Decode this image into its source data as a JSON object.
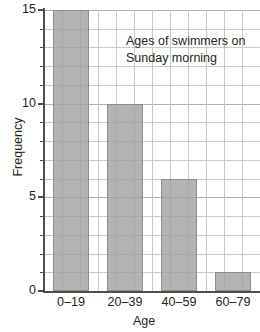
{
  "chart_data": {
    "type": "bar",
    "title": "",
    "annotation": "Ages of swimmers on\nSunday morning",
    "categories": [
      "0–19",
      "20–39",
      "40–59",
      "60–79"
    ],
    "values": [
      15,
      10,
      6,
      1
    ],
    "xlabel": "Age",
    "ylabel": "Frequency",
    "ylim": [
      0,
      15
    ],
    "y_ticks": [
      0,
      5,
      10,
      15
    ],
    "y_tick_labels": [
      "0",
      "5",
      "10",
      "15"
    ],
    "y_minor_step": 1,
    "grid": true,
    "legend": "none",
    "colors": {
      "bar_fill": "#a0a0a0",
      "bar_outline": "#8d8d8d",
      "grid": "#c9c9c9",
      "axis": "#4d4d4d",
      "text": "#231f20",
      "background": "#ffffff"
    }
  }
}
